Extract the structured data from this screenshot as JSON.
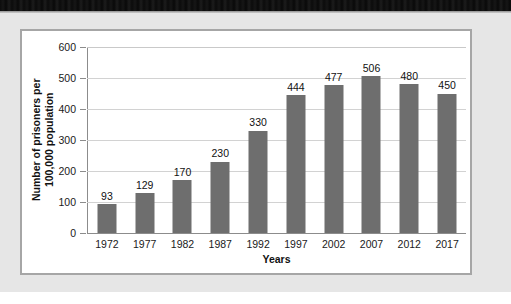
{
  "page": {
    "background_color": "#e6e6e6",
    "frame_border_color": "#a6a6a6"
  },
  "chart_data": {
    "type": "bar",
    "title": "",
    "xlabel": "Years",
    "ylabel": "Number of prisoners per 100,000 population",
    "ylabel_line1": "Number of prisoners per",
    "ylabel_line2": "100,000 population",
    "categories": [
      "1972",
      "1977",
      "1982",
      "1987",
      "1992",
      "1997",
      "2002",
      "2007",
      "2012",
      "2017"
    ],
    "values": [
      93,
      129,
      170,
      230,
      330,
      444,
      477,
      506,
      480,
      450
    ],
    "value_labels": [
      "93",
      "129",
      "170",
      "230",
      "330",
      "444",
      "477",
      "506",
      "480",
      "450"
    ],
    "ylim": [
      0,
      600
    ],
    "ytick_step": 100,
    "ytick_labels": [
      "0",
      "100",
      "200",
      "300",
      "400",
      "500",
      "600"
    ],
    "grid": true,
    "grid_axis": "y",
    "legend": "none",
    "bar_color": "#6e6e6e",
    "grid_color": "#d2d2d2",
    "axis_color": "#8c8c8c",
    "plot_background": "#ffffff"
  }
}
